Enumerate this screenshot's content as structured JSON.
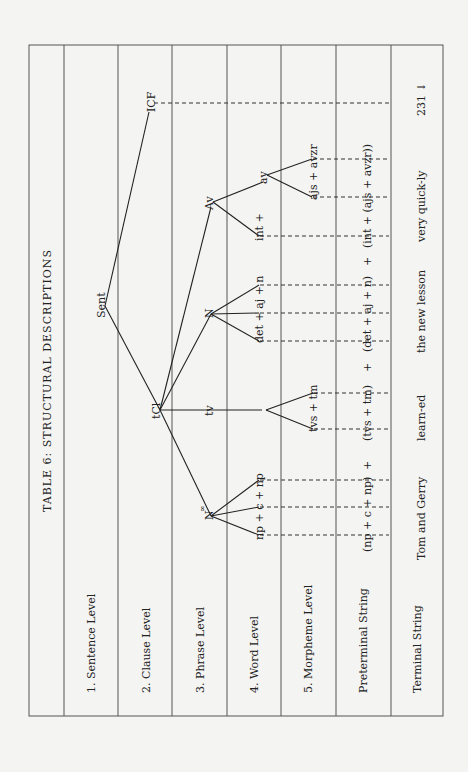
{
  "table": {
    "title": "TABLE 6:   STRUCTURAL DESCRIPTIONS",
    "rows": [
      {
        "label": "1. Sentence Level"
      },
      {
        "label": "2. Clause Level"
      },
      {
        "label": "3. Phrase Level"
      },
      {
        "label": "4. Word Level"
      },
      {
        "label": "5. Morpheme Level"
      },
      {
        "label": "Preterminal String"
      },
      {
        "label": "Terminal String"
      }
    ]
  },
  "tree": {
    "sentence": "Sent",
    "icf": "ICF",
    "clause": "tCl",
    "phrases": {
      "subject": "N",
      "subject_sup": "∞",
      "verb": "tv",
      "object": "N",
      "adverb": "Av"
    },
    "words": {
      "subject": "np + c + np",
      "object": "det + aj + n",
      "adverb_int": "int +",
      "adverb_av": "av"
    },
    "morphemes": {
      "verb": "tvs + tm",
      "adverb": "ajs + avzr"
    }
  },
  "preterminal": {
    "p1": "(np + c + np)",
    "plus1": "+",
    "p2": "(tvs + tm)",
    "plus2": "+",
    "p3": "(det + aj + n)",
    "plus3": "+",
    "p4": "(int + (ajs + avzr))"
  },
  "terminal": {
    "t1": "Tom and Gerry",
    "t2": "learn-ed",
    "t3": "the new lesson",
    "t4": "very quick-ly",
    "t5": "231 ↓"
  }
}
